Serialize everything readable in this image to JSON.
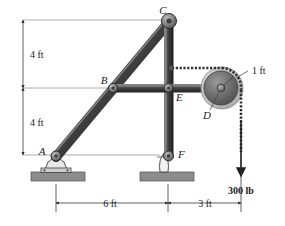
{
  "figure": {
    "background_color": "#ffffff",
    "member_color": "#4a4a4a",
    "member_highlight_color": "#9a9a9a",
    "member_shadow_color": "#262626",
    "support_color": "#8a8a8a",
    "base_plate_color": "#8c8c8c",
    "cable_color": "#333333",
    "dimension_line_color": "#3a3a3a",
    "reference_line_color": "#8e8e8e",
    "pulley_rim_color": "#bdbdbd",
    "pulley_disc_color": "#6e6e6e"
  },
  "joint_labels": {
    "a": "A",
    "b": "B",
    "c": "C",
    "d": "D",
    "e": "E",
    "f": "F"
  },
  "dimensions": {
    "vertical_upper": "4 ft",
    "vertical_lower": "4 ft",
    "horizontal_left": "6 ft",
    "horizontal_right": "3 ft",
    "pulley_radius": "1 ft"
  },
  "load": {
    "magnitude_label": "300 lb",
    "direction": "down"
  },
  "icons": {
    "pin_support_a": "pin-support-icon",
    "rocker_support_f": "rocker-support-icon",
    "pulley": "pulley-icon",
    "load_arrow": "down-arrow-icon",
    "cable": "cable-icon"
  }
}
